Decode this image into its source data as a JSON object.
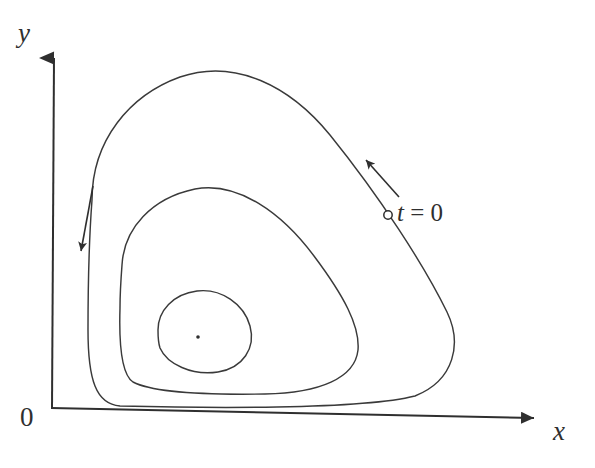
{
  "figure": {
    "kind": "phase-portrait",
    "background_color": "#ffffff",
    "stroke_color": "#2f2f2f",
    "axis_color": "#2f2f2f"
  },
  "axes": {
    "x_label": "x",
    "y_label": "y",
    "origin_label": "0",
    "x_axis": {
      "start_x": 50,
      "start_y": 408,
      "end_x": 548,
      "end_y": 419,
      "arrow": "right"
    },
    "y_axis": {
      "start_x": 51,
      "start_y": 408,
      "end_x": 54,
      "end_y": 42,
      "arrow": "up"
    }
  },
  "annotations": {
    "initial_point_label": "t = 0",
    "initial_point_label_italic": "t",
    "initial_point_label_roman": " = 0",
    "initial_point_marker": "open-circle",
    "initial_point": {
      "x": 388,
      "y": 215,
      "radius": 4.2
    },
    "flow_arrow_outer": {
      "name": "counterclockwise-flow-arrow",
      "from_x": 399,
      "from_y": 197,
      "to_x": 362,
      "to_y": 156
    },
    "flow_arrow_left": {
      "name": "downward-flow-arrow",
      "from_x": 93,
      "from_y": 186,
      "to_x": 80,
      "to_y": 259
    },
    "equilibrium_point": {
      "x": 198,
      "y": 337,
      "radius": 1.8,
      "marker": "filled-dot"
    }
  },
  "chart_data": {
    "type": "line",
    "title": "",
    "xlabel": "x",
    "ylabel": "y",
    "grid": false,
    "legend": null,
    "axis_arrows": true,
    "series": [
      {
        "name": "outer-orbit",
        "closed": true,
        "path": "M 92 200 C 92 140, 130 95, 180 77 C 235 58, 290 86, 330 135 C 380 197, 424 265, 447 312 C 462 343, 455 380, 415 396 C 360 410, 200 408, 120 406 C 96 404, 88 380, 88 330 C 88 290, 89 240, 92 200 Z"
      },
      {
        "name": "middle-orbit",
        "closed": true,
        "path": "M 122 265 C 124 228, 152 198, 195 189 C 238 181, 282 213, 314 256 C 344 296, 360 326, 358 350 C 355 378, 320 393, 265 394 C 205 395, 152 392, 133 382 C 121 374, 119 340, 120 308 C 120 292, 121 278, 122 265 Z"
      },
      {
        "name": "inner-orbit",
        "closed": true,
        "path": "M 158 330 C 158 311, 173 294, 197 291 C 221 288, 244 304, 250 326 C 256 348, 243 368, 218 372 C 192 376, 167 364, 160 348 C 158 342, 158 336, 158 330 Z"
      }
    ],
    "equilibrium": {
      "x": 198,
      "y": 337,
      "label": ""
    },
    "marked_points": [
      {
        "label": "t = 0",
        "x": 388,
        "y": 215,
        "series": "outer-orbit"
      }
    ],
    "flow_direction": "counterclockwise"
  }
}
